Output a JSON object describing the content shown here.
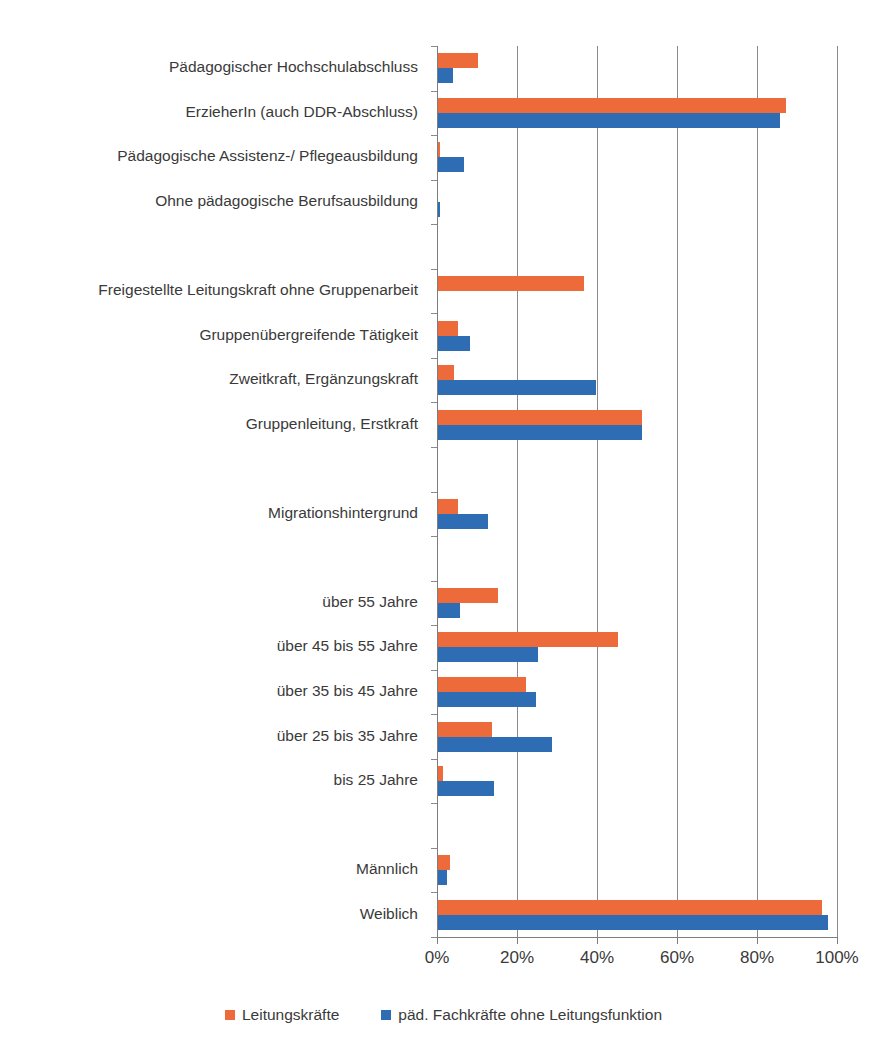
{
  "chart_data": {
    "type": "bar",
    "orientation": "horizontal",
    "title": "",
    "xlabel": "",
    "ylabel": "",
    "xlim": [
      0,
      100
    ],
    "xticks": [
      "0%",
      "20%",
      "40%",
      "60%",
      "80%",
      "100%"
    ],
    "xtick_values": [
      0,
      20,
      40,
      60,
      80,
      100
    ],
    "grid": "vertical",
    "legend_position": "bottom",
    "categories": [
      "Pädagogischer Hochschulabschluss",
      "ErzieherIn (auch DDR-Abschluss)",
      "Pädagogische Assistenz-/ Pflegeausbildung",
      "Ohne pädagogische Berufsausbildung",
      "",
      "Freigestellte Leitungskraft ohne Gruppenarbeit",
      "Gruppenübergreifende Tätigkeit",
      "Zweitkraft, Ergänzungskraft",
      "Gruppenleitung, Erstkraft",
      "",
      "Migrationshintergrund",
      "",
      "über 55 Jahre",
      "über 45 bis 55 Jahre",
      "über 35 bis 45 Jahre",
      "über 25 bis 35 Jahre",
      "bis 25 Jahre",
      "",
      "Männlich",
      "Weiblich"
    ],
    "series": [
      {
        "name": "Leitungskräfte",
        "color": "#ED6A3A",
        "values": [
          10.0,
          87.0,
          0.4,
          0.0,
          null,
          36.5,
          5.0,
          4.0,
          51.0,
          null,
          5.0,
          null,
          15.0,
          45.0,
          22.0,
          13.5,
          1.2,
          null,
          3.0,
          96.0
        ]
      },
      {
        "name": "päd. Fachkräfte ohne Leitungsfunktion",
        "color": "#2E6DB4",
        "values": [
          3.7,
          85.5,
          6.5,
          0.6,
          null,
          0.0,
          8.0,
          39.5,
          51.0,
          null,
          12.5,
          null,
          5.5,
          25.0,
          24.5,
          28.5,
          14.0,
          null,
          2.3,
          97.5
        ]
      }
    ]
  },
  "legend": {
    "entries": [
      {
        "label": "Leitungskräfte",
        "color": "#ED6A3A"
      },
      {
        "label": "päd. Fachkräfte ohne Leitungsfunktion",
        "color": "#2E6DB4"
      }
    ]
  }
}
